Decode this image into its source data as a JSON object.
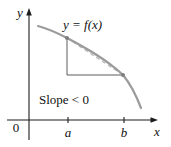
{
  "labels": {
    "curve": "y = f(x)",
    "slope": "Slope < 0",
    "y_axis": "y",
    "x_axis": "x",
    "origin": "0",
    "tick_a": "a",
    "tick_b": "b"
  },
  "colors": {
    "curve": "#9b9b9b",
    "secant": "#b6b6b6",
    "triangle": "#4a4a4a",
    "axis": "#1c1c1c",
    "point": "#7f7f7f",
    "text": "#111111",
    "background": "#ffffff"
  }
}
